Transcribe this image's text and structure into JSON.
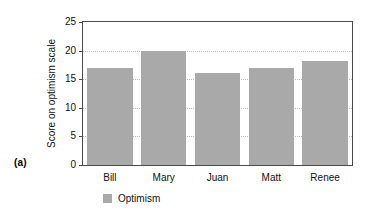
{
  "figure": {
    "panel_letter": "(a)",
    "background_color": "#ffffff"
  },
  "chart_data": {
    "type": "bar",
    "title": "",
    "xlabel": "",
    "ylabel": "Score on optimism scale",
    "categories": [
      "Bill",
      "Mary",
      "Juan",
      "Matt",
      "Renee"
    ],
    "values": [
      17,
      20,
      16,
      17,
      18.2
    ],
    "series": [
      {
        "name": "Optimism",
        "color": "#a9a9a9",
        "values": [
          17,
          20,
          16,
          17,
          18.2
        ]
      }
    ],
    "ylim": [
      0,
      25
    ],
    "yticks": [
      0,
      5,
      10,
      15,
      20,
      25
    ],
    "ytick_labels": [
      "0",
      "5",
      "10",
      "15",
      "20",
      "25"
    ],
    "grid": true,
    "grid_axis": "y",
    "grid_style": "dotted",
    "grid_color": "#b9b9b9",
    "legend": {
      "position": "bottom-left",
      "entries": [
        {
          "label": "Optimism",
          "color": "#a9a9a9"
        }
      ]
    },
    "axis_color": "#4a4a4a",
    "bar_color": "#a9a9a9"
  }
}
